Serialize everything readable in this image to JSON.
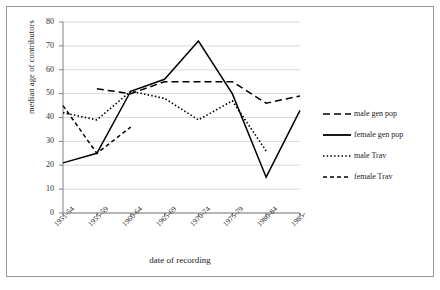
{
  "chart_data": {
    "type": "line",
    "title": "",
    "xlabel": "date of recording",
    "ylabel": "median age of contributors",
    "categories": [
      "1951-54",
      "1955-59",
      "1960-64",
      "1965-69",
      "1970-74",
      "1975-79",
      "1980-84",
      "1985-"
    ],
    "ylim": [
      0,
      80
    ],
    "yticks": [
      0,
      10,
      20,
      30,
      40,
      50,
      60,
      70,
      80
    ],
    "grid": true,
    "legend_position": "right",
    "series": [
      {
        "name": "male gen pop",
        "style": "long-dash",
        "color": "#000000",
        "values": [
          null,
          52,
          50,
          55,
          55,
          55,
          46,
          49
        ]
      },
      {
        "name": "female gen pop",
        "style": "solid",
        "color": "#000000",
        "values": [
          21,
          25,
          51,
          56,
          72,
          50,
          15,
          43
        ]
      },
      {
        "name": "male Trav",
        "style": "dotted",
        "color": "#000000",
        "values": [
          42,
          39,
          51,
          48,
          39,
          47,
          26,
          null
        ]
      },
      {
        "name": "female Trav",
        "style": "short-dash",
        "color": "#000000",
        "values": [
          45,
          25,
          36,
          null,
          null,
          null,
          null,
          null
        ]
      }
    ]
  },
  "axes": {
    "y_tick_labels": [
      "80",
      "70",
      "60",
      "50",
      "40",
      "30",
      "20",
      "10",
      "0"
    ],
    "y_axis_title": "median age of contributors",
    "x_axis_title": "date of recording",
    "x_tick_labels": [
      "1951-54",
      "1955-59",
      "1960-64",
      "1965-69",
      "1970-74",
      "1975-79",
      "1980-84",
      "1985-"
    ]
  },
  "legend": {
    "items": [
      {
        "label": "male gen pop",
        "style": "long-dash"
      },
      {
        "label": "female gen pop",
        "style": "solid"
      },
      {
        "label": "male Trav",
        "style": "dotted"
      },
      {
        "label": "female Trav",
        "style": "short-dash"
      }
    ]
  },
  "colors": {
    "line": "#000000",
    "grid": "#d9d9d9",
    "axis": "#808080",
    "frame": "#9a9a9a",
    "text": "#1a1a1a"
  }
}
